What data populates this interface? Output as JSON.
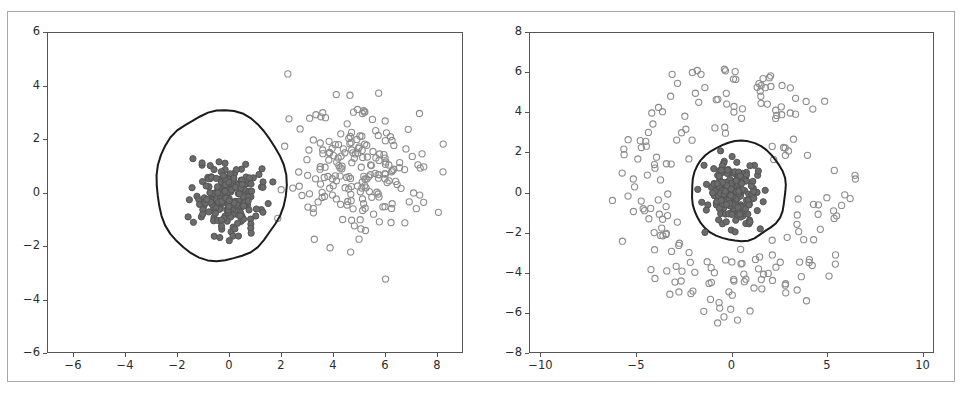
{
  "figure": {
    "background_color": "#ffffff",
    "frame_color": "#a8a8a8",
    "axis_color": "#555555",
    "width": 962,
    "height": 394
  },
  "chart_data": [
    {
      "type": "scatter",
      "panel": "left",
      "title": "",
      "xlabel": "",
      "ylabel": "",
      "xlim": [
        -7,
        9
      ],
      "ylim": [
        -6,
        6
      ],
      "xticks": [
        -6,
        -4,
        -2,
        0,
        2,
        4,
        6,
        8
      ],
      "xtick_labels": [
        "−6",
        "−4",
        "−2",
        "0",
        "2",
        "4",
        "6",
        "8"
      ],
      "yticks": [
        -6,
        -4,
        -2,
        0,
        2,
        4,
        6
      ],
      "ytick_labels": [
        "−6",
        "−4",
        "−2",
        "0",
        "2",
        "4",
        "6"
      ],
      "grid": false,
      "legend": null,
      "series": [
        {
          "name": "inlier-cluster",
          "marker": "filled-circle",
          "color": "#545454",
          "fill": "#6b6b6b",
          "size": 5,
          "note": "dense gaussian blob centered near (0, -0.1), sigma ~0.65, inside the decision contour",
          "center": [
            0.0,
            -0.1
          ],
          "sigma": 0.65,
          "count": 200
        },
        {
          "name": "outlier-cluster",
          "marker": "open-circle",
          "color": "#8c8c8c",
          "fill": "none",
          "size": 5,
          "note": "second gaussian blob centered near (5.0, 0.7), sigma ~1.25, outside the contour",
          "center": [
            5.0,
            0.7
          ],
          "sigma": 1.25,
          "count": 200
        }
      ],
      "contour": {
        "name": "decision-boundary",
        "color": "#1a1a1a",
        "linewidth": 2.0,
        "shape": "irregular-blob",
        "center": [
          -0.35,
          0.3
        ],
        "radius_x": 2.45,
        "radius_y": 2.8
      }
    },
    {
      "type": "scatter",
      "panel": "right",
      "title": "",
      "xlabel": "",
      "ylabel": "",
      "xlim": [
        -10.6,
        10.6
      ],
      "ylim": [
        -8,
        8
      ],
      "xticks": [
        -10,
        -5,
        0,
        5,
        10
      ],
      "xtick_labels": [
        "−10",
        "−5",
        "0",
        "5",
        "10"
      ],
      "yticks": [
        -8,
        -6,
        -4,
        -2,
        0,
        2,
        4,
        6,
        8
      ],
      "ytick_labels": [
        "−8",
        "−6",
        "−4",
        "−2",
        "0",
        "2",
        "4",
        "6",
        "8"
      ],
      "grid": false,
      "legend": null,
      "series": [
        {
          "name": "inlier-cluster",
          "marker": "filled-circle",
          "color": "#545454",
          "fill": "#6b6b6b",
          "size": 5,
          "note": "dense gaussian blob centered near (0, 0), sigma ~0.7, inside the decision contour",
          "center": [
            0.0,
            0.0
          ],
          "sigma": 0.7,
          "count": 200
        },
        {
          "name": "outlier-ring",
          "marker": "open-circle",
          "color": "#8c8c8c",
          "fill": "none",
          "size": 5,
          "note": "annulus of points, radius ~3.3 to ~6.2, surrounding the central blob",
          "radius_min": 3.2,
          "radius_max": 6.3,
          "count": 200
        }
      ],
      "contour": {
        "name": "decision-boundary",
        "color": "#1a1a1a",
        "linewidth": 2.0,
        "shape": "near-circular-blob",
        "center": [
          0.3,
          0.1
        ],
        "radius_x": 2.5,
        "radius_y": 2.45
      }
    }
  ]
}
